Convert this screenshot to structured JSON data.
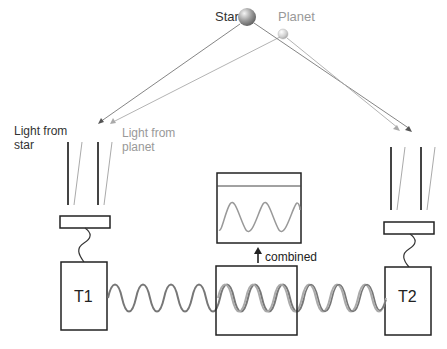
{
  "labels": {
    "star": "Star",
    "planet": "Planet",
    "light_from_star": [
      "Light from",
      "star"
    ],
    "light_from_planet": [
      "Light from",
      "planet"
    ],
    "combined": "combined",
    "telescope_1": "T1",
    "telescope_2": "T2"
  },
  "colors": {
    "star": "#555555",
    "planet": "#999999",
    "outline": "#222222",
    "background": "#ffffff"
  },
  "icons": {
    "star": "sphere-dark",
    "planet": "sphere-light",
    "arrow_up": "arrow-up-icon"
  }
}
